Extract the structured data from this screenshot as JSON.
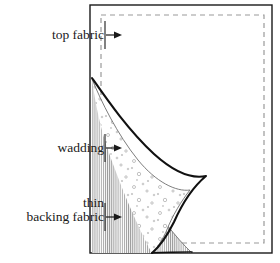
{
  "figure": {
    "background_color": "#ffffff",
    "labels": [
      {
        "id": "top-fabric",
        "lines": [
          "top fabric"
        ],
        "text_anchor_x": 104,
        "text_y": 39,
        "arrow": {
          "x1": 106,
          "y1": 35,
          "x2": 122,
          "y2": 35
        },
        "callout_rule": {
          "x": 105,
          "y1": 21,
          "y2": 49
        }
      },
      {
        "id": "wadding",
        "lines": [
          "wadding"
        ],
        "text_anchor_x": 104,
        "text_y": 152,
        "arrow": {
          "x1": 106,
          "y1": 148,
          "x2": 122,
          "y2": 148
        },
        "callout_rule": {
          "x": 105,
          "y1": 134,
          "y2": 162
        }
      },
      {
        "id": "backing-fabric",
        "lines": [
          "thin",
          "backing fabric"
        ],
        "text_anchor_x": 104,
        "text_y": 221,
        "arrow": {
          "x1": 106,
          "y1": 217,
          "x2": 122,
          "y2": 217
        },
        "callout_rule": {
          "x": 105,
          "y1": 203,
          "y2": 231
        }
      }
    ],
    "colors": {
      "outline": "#1a1a1a",
      "top_fabric_curve": "#111111",
      "wadding_curve": "#6e6e6e",
      "backing_hatch": "#8c8c8c",
      "dashed_guide": "#9a9a9a",
      "wadding_stipple": "#9a9a9a",
      "text": "#1a1a1a"
    },
    "outer_frame": {
      "x": 90,
      "y": 5,
      "width": 182,
      "height": 248,
      "stroke_width": 1.4
    },
    "dashed_frame": {
      "x": 101,
      "y": 15,
      "width": 163,
      "height": 228,
      "stroke_width": 1.2,
      "dash": "5 4"
    },
    "curve_apex": {
      "x": 92,
      "y": 78
    },
    "curve_tip": {
      "x": 206,
      "y": 176
    },
    "curve_foot": {
      "x": 204,
      "y": 253
    }
  }
}
